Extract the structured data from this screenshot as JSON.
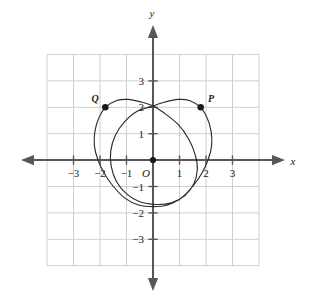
{
  "chart_data": {
    "type": "line",
    "title": "",
    "xlabel": "x",
    "ylabel": "y",
    "xlim": [
      -4,
      4
    ],
    "ylim": [
      -4,
      4
    ],
    "grid": true,
    "grid_spacing": 1,
    "legend": "none",
    "origin_label": "O",
    "x_ticks": [
      {
        "value": -3,
        "label": "−3"
      },
      {
        "value": -2,
        "label": "−2"
      },
      {
        "value": -1,
        "label": "−1"
      },
      {
        "value": 1,
        "label": "1"
      },
      {
        "value": 2,
        "label": "2"
      },
      {
        "value": 3,
        "label": "3"
      }
    ],
    "y_ticks": [
      {
        "value": 3,
        "label": "3"
      },
      {
        "value": 2,
        "label": "2"
      },
      {
        "value": 1,
        "label": "1"
      },
      {
        "value": -1,
        "label": "−1"
      },
      {
        "value": -2,
        "label": "−2"
      },
      {
        "value": -3,
        "label": "−3"
      }
    ],
    "annotations": [
      {
        "name": "P",
        "label": "P",
        "x": 1.8,
        "y": 2.0
      },
      {
        "name": "Q",
        "label": "Q",
        "x": -1.8,
        "y": 2.0
      }
    ],
    "curve_name": "limacon-heart-curve",
    "curve_description": "Closed limacon-type curve with inner loop, self-intersection at (0, 2.05)",
    "curve_points": [
      [
        0.0,
        2.05
      ],
      [
        0.45,
        2.2
      ],
      [
        0.95,
        2.3
      ],
      [
        1.4,
        2.25
      ],
      [
        1.8,
        2.0
      ],
      [
        2.05,
        1.6
      ],
      [
        2.2,
        1.1
      ],
      [
        2.22,
        0.55
      ],
      [
        2.1,
        0.05
      ],
      [
        1.85,
        -0.5
      ],
      [
        1.5,
        -1.0
      ],
      [
        1.05,
        -1.45
      ],
      [
        0.55,
        -1.7
      ],
      [
        0.0,
        -1.76
      ],
      [
        -0.55,
        -1.7
      ],
      [
        -1.05,
        -1.45
      ],
      [
        -1.5,
        -1.0
      ],
      [
        -1.85,
        -0.5
      ],
      [
        -2.1,
        0.05
      ],
      [
        -2.22,
        0.55
      ],
      [
        -2.2,
        1.1
      ],
      [
        -2.05,
        1.6
      ],
      [
        -1.8,
        2.0
      ],
      [
        -1.4,
        2.25
      ],
      [
        -0.95,
        2.3
      ],
      [
        -0.45,
        2.2
      ],
      [
        0.0,
        2.05
      ],
      [
        0.4,
        1.8
      ],
      [
        0.95,
        1.35
      ],
      [
        1.35,
        0.8
      ],
      [
        1.6,
        0.2
      ],
      [
        1.68,
        -0.35
      ],
      [
        1.55,
        -0.9
      ],
      [
        1.2,
        -1.35
      ],
      [
        0.7,
        -1.62
      ],
      [
        0.1,
        -1.68
      ],
      [
        -0.5,
        -1.58
      ],
      [
        -1.0,
        -1.28
      ],
      [
        -1.38,
        -0.82
      ],
      [
        -1.58,
        -0.25
      ],
      [
        -1.6,
        0.35
      ],
      [
        -1.42,
        0.95
      ],
      [
        -1.08,
        1.45
      ],
      [
        -0.6,
        1.85
      ],
      [
        0.0,
        2.05
      ]
    ]
  }
}
